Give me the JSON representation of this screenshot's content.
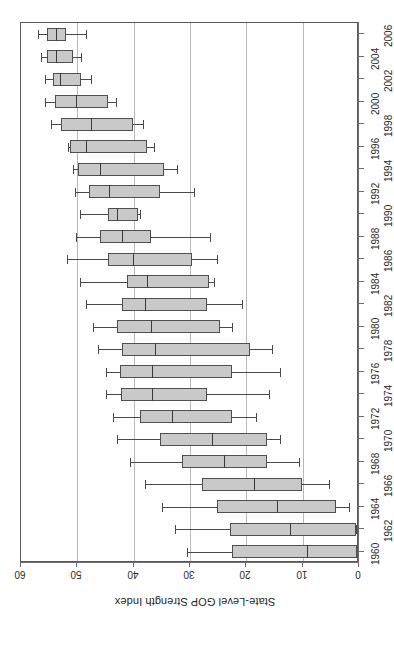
{
  "chart_data": {
    "type": "boxplot",
    "title": "",
    "subtitle": "",
    "orientation": "horizontal-rotated",
    "xlabel": "",
    "ylabel": "State-Level GOP Strength Index",
    "value_axis": {
      "label": "State-Level GOP Strength Index",
      "ticks": [
        60,
        50,
        40,
        30,
        20,
        10,
        0
      ],
      "tick_labels": [
        "60",
        "50",
        "40",
        "30",
        "20",
        "10",
        "0"
      ],
      "range": [
        0,
        60
      ],
      "direction": "descending-left-to-right"
    },
    "category_axis": {
      "label": "",
      "categories": [
        2006,
        2004,
        2002,
        2000,
        1998,
        1996,
        1994,
        1992,
        1990,
        1988,
        1986,
        1984,
        1982,
        1980,
        1978,
        1976,
        1974,
        1972,
        1970,
        1968,
        1966,
        1964,
        1962,
        1960
      ],
      "tick_labels": [
        "2006",
        "2004",
        "2002",
        "2000",
        "1998",
        "1996",
        "1994",
        "1992",
        "1990",
        "1988",
        "1986",
        "1984",
        "1982",
        "1980",
        "1978",
        "1976",
        "1974",
        "1972",
        "1970",
        "1968",
        "1966",
        "1964",
        "1962",
        "1960"
      ],
      "interval": 2,
      "stagger": true
    },
    "grid": {
      "vertical": true,
      "horizontal": false,
      "gridline_values": [
        50,
        40,
        30,
        20,
        10
      ]
    },
    "legend": {
      "visible": false,
      "position": "none",
      "entries": []
    },
    "colors": {
      "box_fill": "#c9c9c9",
      "box_stroke": "#4f4f4f",
      "median": "#3a3a3a",
      "whisker": "#4a4a4a",
      "grid": "#b9b9b9",
      "axis": "#6d6d6d",
      "background": "#ffffff"
    },
    "boxes": [
      {
        "category": "2006",
        "min": 57.0,
        "q1": 55.4,
        "median": 53.8,
        "q3": 52.0,
        "max": 48.5
      },
      {
        "category": "2004",
        "min": 56.4,
        "q1": 55.4,
        "median": 53.8,
        "q3": 50.8,
        "max": 49.4
      },
      {
        "category": "2002",
        "min": 55.7,
        "q1": 54.3,
        "median": 53.1,
        "q3": 49.4,
        "max": 47.6
      },
      {
        "category": "2000",
        "min": 55.7,
        "q1": 54.0,
        "median": 50.3,
        "q3": 44.6,
        "max": 43.2
      },
      {
        "category": "1998",
        "min": 54.7,
        "q1": 52.9,
        "median": 47.6,
        "q3": 40.2,
        "max": 38.4
      },
      {
        "category": "1996",
        "min": 51.7,
        "q1": 51.3,
        "median": 48.5,
        "q3": 37.6,
        "max": 36.4
      },
      {
        "category": "1994",
        "min": 50.8,
        "q1": 49.9,
        "median": 46.0,
        "q3": 34.6,
        "max": 32.3
      },
      {
        "category": "1992",
        "min": 50.4,
        "q1": 48.0,
        "median": 44.3,
        "q3": 35.3,
        "max": 29.3
      },
      {
        "category": "1990",
        "min": 49.6,
        "q1": 44.6,
        "median": 42.9,
        "q3": 39.3,
        "max": 38.8
      },
      {
        "category": "1988",
        "min": 50.3,
        "q1": 46.0,
        "median": 42.0,
        "q3": 37.0,
        "max": 26.5
      },
      {
        "category": "1986",
        "min": 51.9,
        "q1": 44.6,
        "median": 40.2,
        "q3": 29.6,
        "max": 25.2
      },
      {
        "category": "1984",
        "min": 49.6,
        "q1": 41.1,
        "median": 37.6,
        "q3": 26.6,
        "max": 25.7
      },
      {
        "category": "1982",
        "min": 48.5,
        "q1": 42.0,
        "median": 37.9,
        "q3": 27.0,
        "max": 20.8
      },
      {
        "category": "1980",
        "min": 47.3,
        "q1": 42.9,
        "median": 37.0,
        "q3": 24.7,
        "max": 22.6
      },
      {
        "category": "1978",
        "min": 46.4,
        "q1": 42.0,
        "median": 36.2,
        "q3": 19.4,
        "max": 15.5
      },
      {
        "category": "1976",
        "min": 45.0,
        "q1": 42.5,
        "median": 36.7,
        "q3": 22.6,
        "max": 14.1
      },
      {
        "category": "1974",
        "min": 45.0,
        "q1": 42.3,
        "median": 36.7,
        "q3": 27.0,
        "max": 15.9
      },
      {
        "category": "1972",
        "min": 43.7,
        "q1": 38.8,
        "median": 33.2,
        "q3": 22.6,
        "max": 18.2
      },
      {
        "category": "1970",
        "min": 42.9,
        "q1": 35.3,
        "median": 26.1,
        "q3": 16.4,
        "max": 14.1
      },
      {
        "category": "1968",
        "min": 40.6,
        "q1": 31.4,
        "median": 24.0,
        "q3": 16.4,
        "max": 10.6
      },
      {
        "category": "1966",
        "min": 37.9,
        "q1": 27.9,
        "median": 18.7,
        "q3": 10.2,
        "max": 5.3
      },
      {
        "category": "1964",
        "min": 34.9,
        "q1": 25.2,
        "median": 14.6,
        "q3": 4.1,
        "max": 1.8
      },
      {
        "category": "1962",
        "min": 32.6,
        "q1": 22.9,
        "median": 12.3,
        "q3": 0.5,
        "max": 0.5
      },
      {
        "category": "1960",
        "min": 30.5,
        "q1": 22.6,
        "median": 9.3,
        "q3": 0.3,
        "max": 0.3
      }
    ]
  }
}
